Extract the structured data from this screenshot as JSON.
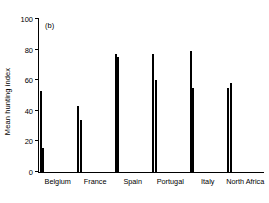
{
  "chart_data": {
    "type": "bar",
    "title": "",
    "panel_label": "(b)",
    "xlabel": "",
    "ylabel": "Mean hunting index",
    "ylim": [
      0,
      100
    ],
    "yticks": [
      0,
      20,
      40,
      60,
      80,
      100
    ],
    "grid": false,
    "legend": "none",
    "categories": [
      "Belgium",
      "France",
      "Spain",
      "Portugal",
      "Italy",
      "North Africa"
    ],
    "series": [
      {
        "name": "filled",
        "style": "solid-black",
        "values": [
          53,
          43,
          77,
          77,
          79,
          55
        ]
      },
      {
        "name": "open",
        "style": "open-white",
        "values": [
          16,
          34,
          75,
          60,
          55,
          58
        ]
      }
    ]
  }
}
